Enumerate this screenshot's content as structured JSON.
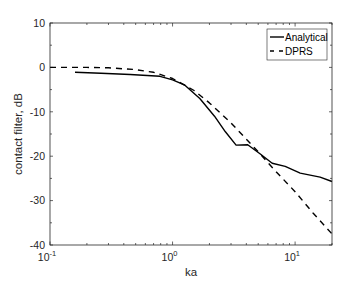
{
  "chart_data": {
    "type": "line",
    "title": "",
    "xlabel": "ka",
    "ylabel": "contact filter, dB",
    "xscale": "log",
    "xlim": [
      0.1,
      20
    ],
    "ylim": [
      -40,
      10
    ],
    "x_ticks": [
      {
        "value": 0.1,
        "base": "10",
        "exp": "-1"
      },
      {
        "value": 1,
        "base": "10",
        "exp": "0"
      },
      {
        "value": 10,
        "base": "10",
        "exp": "1"
      }
    ],
    "y_ticks": [
      10,
      0,
      -10,
      -20,
      -30,
      -40
    ],
    "grid": false,
    "legend_position": "upper right",
    "series": [
      {
        "name": "Analytical",
        "style": "solid",
        "color": "#000000",
        "x": [
          0.16,
          0.26,
          0.45,
          0.79,
          1.0,
          1.26,
          1.67,
          2.2,
          2.7,
          3.3,
          4.1,
          5.2,
          6.5,
          8.3,
          11,
          16,
          20
        ],
        "y": [
          -1.1,
          -1.3,
          -1.6,
          -2.0,
          -2.8,
          -4.0,
          -7.0,
          -11.0,
          -14.5,
          -17.5,
          -17.4,
          -19.5,
          -21.6,
          -22.3,
          -23.8,
          -24.7,
          -25.7
        ]
      },
      {
        "name": "DPRS",
        "style": "dashed",
        "color": "#000000",
        "x": [
          0.1,
          0.2,
          0.3,
          0.5,
          0.7,
          1.0,
          1.5,
          2.0,
          3.0,
          5.0,
          7.0,
          10,
          14,
          20
        ],
        "y": [
          0,
          0,
          -0.1,
          -0.5,
          -1.1,
          -2.5,
          -5.2,
          -8.0,
          -12.5,
          -19.0,
          -23.5,
          -28.0,
          -32.8,
          -37.5
        ]
      }
    ]
  }
}
